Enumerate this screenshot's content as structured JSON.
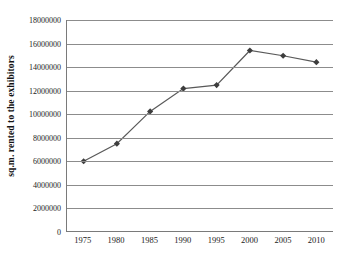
{
  "chart_data": {
    "type": "line",
    "title": "",
    "xlabel": "",
    "ylabel": "sq.m. rented to the exhibitors",
    "categories": [
      "1975",
      "1980",
      "1985",
      "1990",
      "1995",
      "2000",
      "2005",
      "2010"
    ],
    "values": [
      5950000,
      7450000,
      10200000,
      12150000,
      12450000,
      15400000,
      14950000,
      14400000
    ],
    "series": [
      {
        "name": "sq.m. rented to the exhibitors",
        "values": [
          5950000,
          7450000,
          10200000,
          12150000,
          12450000,
          15400000,
          14950000,
          14400000
        ]
      }
    ],
    "ylim": [
      0,
      18000000
    ],
    "y_ticks": [
      0,
      2000000,
      4000000,
      6000000,
      8000000,
      10000000,
      12000000,
      14000000,
      16000000,
      18000000
    ],
    "y_tick_labels": [
      "0",
      "2000000",
      "4000000",
      "6000000",
      "8000000",
      "10000000",
      "12000000",
      "14000000",
      "16000000",
      "18000000"
    ],
    "grid": "horizontal",
    "legend": "none",
    "marker": "diamond",
    "line_color": "#595959",
    "marker_color": "#3d3d3d",
    "grid_color": "#8c8c8c",
    "axis_color": "#7a7a7a",
    "background_color": "#ffffff"
  }
}
